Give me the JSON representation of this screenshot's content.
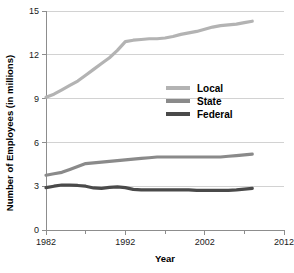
{
  "chart_data": {
    "type": "line",
    "title": "",
    "xlabel": "Year",
    "ylabel": "Number of Employees (in millions)",
    "xlim": [
      1982,
      2012
    ],
    "ylim": [
      0,
      15
    ],
    "grid": true,
    "legend_position": "center-right",
    "x_ticks": [
      1982,
      1992,
      2002,
      2012
    ],
    "x_tick_labels": [
      "1982",
      "1992",
      "2002",
      "2012"
    ],
    "x_minor_ticks": [
      1987,
      1997,
      2007
    ],
    "y_ticks": [
      0,
      3,
      6,
      9,
      12,
      15
    ],
    "y_tick_labels": [
      "0",
      "3",
      "6",
      "9",
      "12",
      "15"
    ],
    "x": [
      1982,
      1983,
      1984,
      1985,
      1986,
      1987,
      1988,
      1989,
      1990,
      1991,
      1992,
      1993,
      1994,
      1995,
      1996,
      1997,
      1998,
      1999,
      2000,
      2001,
      2002,
      2003,
      2004,
      2005,
      2006,
      2007,
      2008
    ],
    "series": [
      {
        "name": "Local",
        "color": "#b3b3b3",
        "values": [
          9.1,
          9.3,
          9.6,
          9.9,
          10.2,
          10.6,
          11.0,
          11.4,
          11.8,
          12.3,
          12.9,
          13.0,
          13.05,
          13.1,
          13.1,
          13.15,
          13.25,
          13.4,
          13.5,
          13.6,
          13.75,
          13.9,
          14.0,
          14.05,
          14.1,
          14.2,
          14.3
        ]
      },
      {
        "name": "State",
        "color": "#8a8a8a",
        "values": [
          3.75,
          3.85,
          3.95,
          4.15,
          4.35,
          4.55,
          4.6,
          4.65,
          4.7,
          4.75,
          4.8,
          4.85,
          4.9,
          4.95,
          5.0,
          5.0,
          5.0,
          5.0,
          5.0,
          5.0,
          5.0,
          5.0,
          5.0,
          5.05,
          5.1,
          5.15,
          5.2
        ]
      },
      {
        "name": "Federal",
        "color": "#4a4a4a",
        "values": [
          2.9,
          3.0,
          3.08,
          3.08,
          3.05,
          3.0,
          2.88,
          2.85,
          2.92,
          2.95,
          2.9,
          2.78,
          2.75,
          2.75,
          2.75,
          2.75,
          2.75,
          2.75,
          2.75,
          2.72,
          2.72,
          2.72,
          2.72,
          2.72,
          2.75,
          2.8,
          2.85
        ]
      }
    ]
  },
  "legend": {
    "items": [
      {
        "label": "Local"
      },
      {
        "label": "State"
      },
      {
        "label": "Federal"
      }
    ]
  }
}
